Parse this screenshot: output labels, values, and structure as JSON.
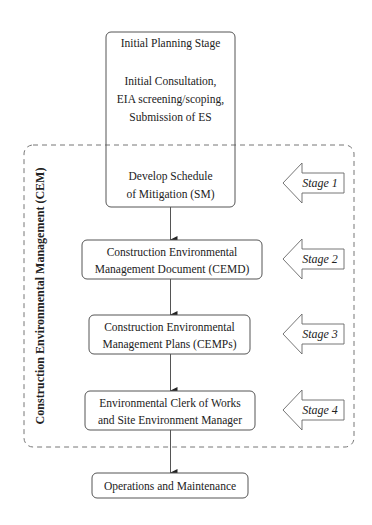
{
  "diagram": {
    "frame": {
      "label": "Construction Environmental Management (CEM)"
    },
    "nodes": [
      {
        "id": "initial",
        "lines": [
          "Initial Planning Stage",
          "",
          "Initial Consultation,",
          "EIA screening/scoping,",
          "Submission of ES",
          "",
          "",
          "Develop Schedule",
          "of Mitigation (SM)"
        ]
      },
      {
        "id": "cemd",
        "lines": [
          "Construction Environmental",
          "Management Document (CEMD)"
        ]
      },
      {
        "id": "cemps",
        "lines": [
          "Construction Environmental",
          "Management Plans (CEMPs)"
        ]
      },
      {
        "id": "ecow",
        "lines": [
          "Environmental Clerk of Works",
          "and Site Environment Manager"
        ]
      },
      {
        "id": "ops",
        "lines": [
          "Operations and Maintenance"
        ]
      }
    ],
    "stages": [
      {
        "label": "Stage 1"
      },
      {
        "label": "Stage 2"
      },
      {
        "label": "Stage 3"
      },
      {
        "label": "Stage 4"
      }
    ],
    "colors": {
      "stroke": "#555555",
      "dashed": "#777777",
      "text": "#222222"
    }
  }
}
